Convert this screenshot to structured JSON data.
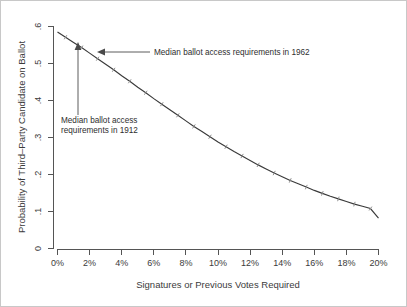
{
  "chart_data": {
    "type": "line",
    "title": "",
    "subtitle": "",
    "xlabel": "Signatures or Previous Votes Required",
    "ylabel": "Probability of Third–Party Candidate on Ballot",
    "xlim": [
      0,
      20
    ],
    "ylim": [
      0,
      0.6
    ],
    "grid": false,
    "legend": "none",
    "x_tick_labels": [
      "0%",
      "2%",
      "4%",
      "6%",
      "8%",
      "10%",
      "12%",
      "14%",
      "16%",
      "18%",
      "20%"
    ],
    "x_tick_values": [
      0,
      2,
      4,
      6,
      8,
      10,
      12,
      14,
      16,
      18,
      20
    ],
    "y_tick_labels": [
      "0",
      ".1",
      ".2",
      ".3",
      ".4",
      ".5",
      ".6"
    ],
    "y_tick_values": [
      0,
      0.1,
      0.2,
      0.3,
      0.4,
      0.5,
      0.6
    ],
    "series": [
      {
        "name": "Predicted probability",
        "marker": "tick",
        "color": "#3a3a3a",
        "x": [
          0,
          0.5,
          1,
          1.5,
          2,
          2.5,
          3,
          3.5,
          4,
          4.5,
          5,
          5.5,
          6,
          6.5,
          7,
          7.5,
          8,
          8.5,
          9,
          9.5,
          10,
          10.5,
          11,
          11.5,
          12,
          12.5,
          13,
          13.5,
          14,
          14.5,
          15,
          15.5,
          16,
          16.5,
          17,
          17.5,
          18,
          18.5,
          19,
          19.5,
          20
        ],
        "values": [
          0.585,
          0.571,
          0.557,
          0.543,
          0.528,
          0.513,
          0.498,
          0.483,
          0.467,
          0.452,
          0.436,
          0.421,
          0.405,
          0.39,
          0.375,
          0.36,
          0.345,
          0.33,
          0.316,
          0.302,
          0.288,
          0.275,
          0.262,
          0.25,
          0.238,
          0.226,
          0.215,
          0.204,
          0.194,
          0.184,
          0.175,
          0.166,
          0.157,
          0.149,
          0.141,
          0.134,
          0.127,
          0.12,
          0.114,
          0.108,
          0.082
        ]
      }
    ],
    "annotations": [
      {
        "id": "annot-1962",
        "text": "Median ballot access requirements in 1962",
        "arrow": "left",
        "target_x": 2.8,
        "target_y": 0.512
      },
      {
        "id": "annot-1912",
        "text_line_1": "Median ballot access",
        "text_line_2": "requirements in 1912",
        "arrow": "up",
        "target_x": 1.3,
        "target_y": 0.545
      }
    ]
  }
}
